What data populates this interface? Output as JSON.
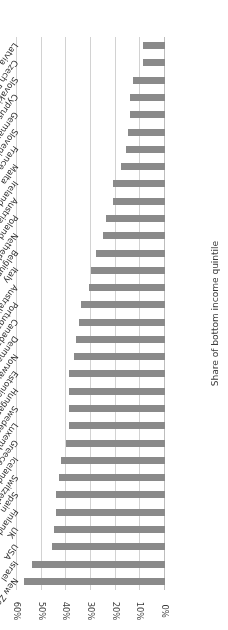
{
  "chart_data": {
    "type": "bar",
    "orientation": "horizontal",
    "title": "",
    "xlabel": "",
    "ylabel": "Share of bottom income quintile",
    "ylim": [
      0,
      60
    ],
    "grid": true,
    "legend": false,
    "value_suffix": "%",
    "tick_labels": [
      "0%",
      "10%",
      "20%",
      "30%",
      "40%",
      "50%",
      "60%"
    ],
    "ticks": [
      0,
      10,
      20,
      30,
      40,
      50,
      60
    ],
    "categories": [
      "New Zealand",
      "Israel",
      "USA",
      "UK",
      "Finland",
      "Spain",
      "Switzerland",
      "Iceland",
      "Greece",
      "Luxembourg",
      "Sweden",
      "Hungary",
      "Estonia",
      "Norway",
      "Denmark",
      "Canada",
      "Portugal",
      "Australia",
      "Italy",
      "Belgium",
      "Netherlands",
      "Poland",
      "Austria",
      "Ireland",
      "Malta",
      "France",
      "Slovenia",
      "Germany",
      "Cyprus",
      "Slovakia",
      "Czech Republic",
      "Latvia"
    ],
    "values": [
      57,
      54,
      46,
      45,
      44,
      44,
      43,
      42,
      40,
      39,
      39,
      39,
      39,
      37,
      36,
      35,
      34,
      31,
      30,
      28,
      25,
      24,
      21,
      21,
      18,
      16,
      15,
      14,
      14,
      13,
      9,
      9
    ],
    "series": [
      {
        "name": "Share of bottom income quintile",
        "color": "#8a8a8a",
        "values": [
          57,
          54,
          46,
          45,
          44,
          44,
          43,
          42,
          40,
          39,
          39,
          39,
          39,
          37,
          36,
          35,
          34,
          31,
          30,
          28,
          25,
          24,
          21,
          21,
          18,
          16,
          15,
          14,
          14,
          13,
          9,
          9
        ]
      }
    ]
  },
  "style": {
    "bar_color": "#8a8a8a",
    "grid_color": "#d2d2d2",
    "axis_color": "#bdbdbd",
    "text_color": "#2e2e2e",
    "background": "#ffffff"
  }
}
